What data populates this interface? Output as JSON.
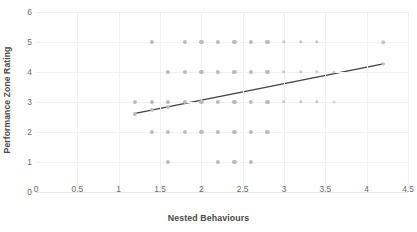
{
  "chart_data": {
    "type": "scatter",
    "title": "",
    "xlabel": "Nested Behaviours",
    "ylabel": "Performance Zone Rating",
    "xlim": [
      0,
      4.5
    ],
    "ylim": [
      0,
      6
    ],
    "xticks": [
      "0",
      "0.5",
      "1",
      "1.5",
      "2",
      "2.5",
      "3",
      "3.5",
      "4",
      "4.5"
    ],
    "xtick_values": [
      0,
      0.5,
      1,
      1.5,
      2,
      2.5,
      3,
      3.5,
      4,
      4.5
    ],
    "yticks": [
      "0",
      "1",
      "2",
      "3",
      "4",
      "5",
      "6"
    ],
    "ytick_values": [
      0,
      1,
      2,
      3,
      4,
      5,
      6
    ],
    "grid": true,
    "legend": "none",
    "marker_color": "#b9bbbe",
    "trendline_color": "#404040",
    "points": [
      {
        "x": 1.2,
        "y": 3
      },
      {
        "x": 1.2,
        "y": 2.6
      },
      {
        "x": 1.4,
        "y": 5
      },
      {
        "x": 1.4,
        "y": 3
      },
      {
        "x": 1.4,
        "y": 2.75
      },
      {
        "x": 1.4,
        "y": 2
      },
      {
        "x": 1.6,
        "y": 4
      },
      {
        "x": 1.6,
        "y": 3
      },
      {
        "x": 1.6,
        "y": 2.85
      },
      {
        "x": 1.6,
        "y": 2
      },
      {
        "x": 1.6,
        "y": 1
      },
      {
        "x": 1.8,
        "y": 5
      },
      {
        "x": 1.8,
        "y": 4
      },
      {
        "x": 1.8,
        "y": 3
      },
      {
        "x": 1.8,
        "y": 2
      },
      {
        "x": 2.0,
        "y": 5
      },
      {
        "x": 2.0,
        "y": 4
      },
      {
        "x": 2.0,
        "y": 3
      },
      {
        "x": 2.0,
        "y": 2
      },
      {
        "x": 2.2,
        "y": 5
      },
      {
        "x": 2.2,
        "y": 4
      },
      {
        "x": 2.2,
        "y": 3
      },
      {
        "x": 2.2,
        "y": 2
      },
      {
        "x": 2.2,
        "y": 1
      },
      {
        "x": 2.4,
        "y": 5
      },
      {
        "x": 2.4,
        "y": 4
      },
      {
        "x": 2.4,
        "y": 3
      },
      {
        "x": 2.4,
        "y": 2
      },
      {
        "x": 2.4,
        "y": 1
      },
      {
        "x": 2.6,
        "y": 5
      },
      {
        "x": 2.6,
        "y": 4
      },
      {
        "x": 2.6,
        "y": 3
      },
      {
        "x": 2.6,
        "y": 2
      },
      {
        "x": 2.6,
        "y": 1
      },
      {
        "x": 2.8,
        "y": 5
      },
      {
        "x": 2.8,
        "y": 4
      },
      {
        "x": 2.8,
        "y": 3
      },
      {
        "x": 2.8,
        "y": 2
      },
      {
        "x": 3.0,
        "y": 5
      },
      {
        "x": 3.0,
        "y": 4
      },
      {
        "x": 3.0,
        "y": 3
      },
      {
        "x": 3.2,
        "y": 5
      },
      {
        "x": 3.2,
        "y": 4
      },
      {
        "x": 3.2,
        "y": 3
      },
      {
        "x": 3.4,
        "y": 5
      },
      {
        "x": 3.4,
        "y": 4
      },
      {
        "x": 3.4,
        "y": 3
      },
      {
        "x": 3.6,
        "y": 4
      },
      {
        "x": 3.6,
        "y": 3
      },
      {
        "x": 4.2,
        "y": 5
      },
      {
        "x": 4.2,
        "y": 4.27
      }
    ],
    "trendline": {
      "x_start": 1.2,
      "y_start": 2.62,
      "x_end": 4.2,
      "y_end": 4.27
    }
  }
}
